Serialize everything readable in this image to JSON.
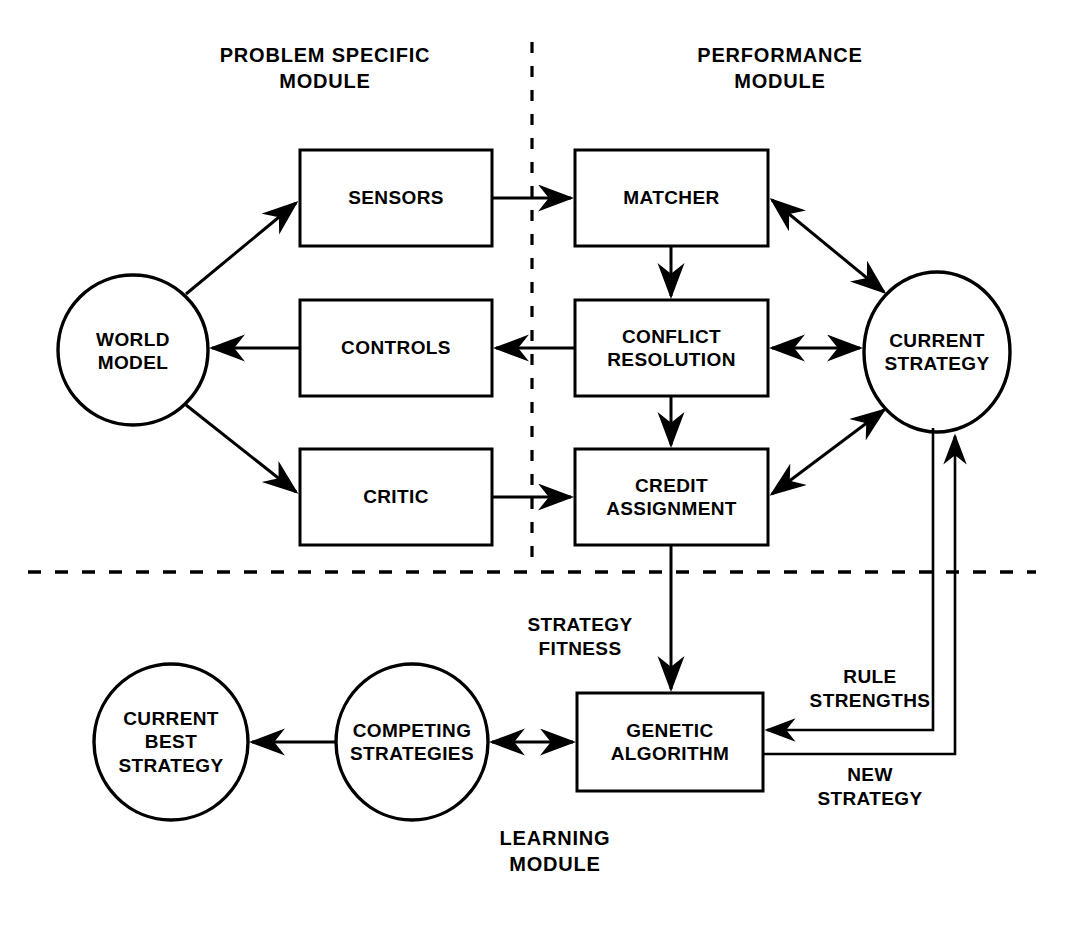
{
  "diagram": {
    "title_problem_specific": "PROBLEM SPECIFIC\nMODULE",
    "title_performance": "PERFORMANCE\nMODULE",
    "title_learning": "LEARNING\nMODULE"
  },
  "nodes": {
    "world_model": "WORLD\nMODEL",
    "sensors": "SENSORS",
    "controls": "CONTROLS",
    "critic": "CRITIC",
    "matcher": "MATCHER",
    "conflict_resolution": "CONFLICT\nRESOLUTION",
    "credit_assignment": "CREDIT\nASSIGNMENT",
    "current_strategy": "CURRENT\nSTRATEGY",
    "genetic_algorithm": "GENETIC\nALGORITHM",
    "competing_strategies": "COMPETING\nSTRATEGIES",
    "current_best_strategy": "CURRENT\nBEST\nSTRATEGY"
  },
  "edge_labels": {
    "strategy_fitness": "STRATEGY\nFITNESS",
    "rule_strengths": "RULE\nSTRENGTHS",
    "new_strategy": "NEW\nSTRATEGY"
  },
  "style": {
    "stroke": "#000000",
    "fill": "#ffffff",
    "background": "#ffffff"
  }
}
